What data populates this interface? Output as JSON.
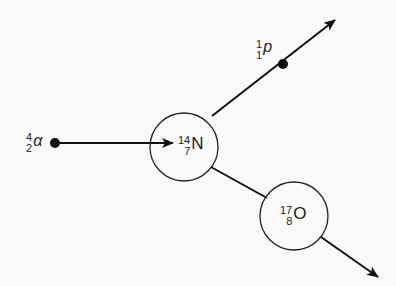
{
  "diagram": {
    "colors": {
      "line": "#111111",
      "text": "#2a2a2a",
      "background": "#fafafa"
    },
    "particles": {
      "alpha": {
        "mass": "4",
        "charge": "2",
        "symbol": "α"
      },
      "nitrogen": {
        "mass": "14",
        "charge": "7",
        "symbol": "N"
      },
      "proton": {
        "mass": "1",
        "charge": "1",
        "symbol": "p"
      },
      "oxygen": {
        "mass": "17",
        "charge": "8",
        "symbol": "O"
      }
    }
  }
}
